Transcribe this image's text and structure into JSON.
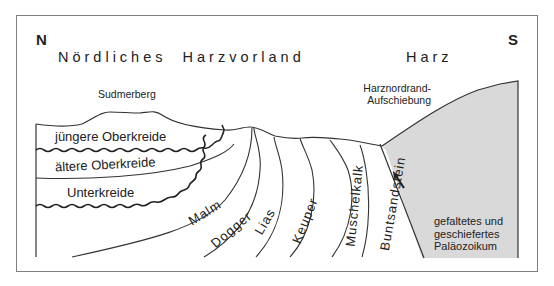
{
  "directions": {
    "north": "N",
    "south": "S"
  },
  "regions": {
    "foreland": "Nördliches  Harzvorland",
    "harz": "Harz"
  },
  "features": {
    "sudmerberg": "Sudmerberg",
    "thrust_line1": "Harznordrand-",
    "thrust_line2": "Aufschiebung"
  },
  "layers": {
    "juengere_oberkreide": "jüngere Oberkreide",
    "aeltere_oberkreide": "ältere Oberkreide",
    "unterkreide": "Unterkreide",
    "malm": "Malm",
    "dogger": "Dogger",
    "lias": "Lias",
    "keuper": "Keuper",
    "muschelkalk": "Muschelkalk",
    "buntsandstein": "Buntsandstein"
  },
  "palaeozoic": {
    "line1": "gefaltetes und",
    "line2": "geschiefertes",
    "line3": "Paläozoikum"
  },
  "colors": {
    "palaeozoic_fill": "#d9d9d9",
    "line": "#333333",
    "frame": "#808080"
  }
}
